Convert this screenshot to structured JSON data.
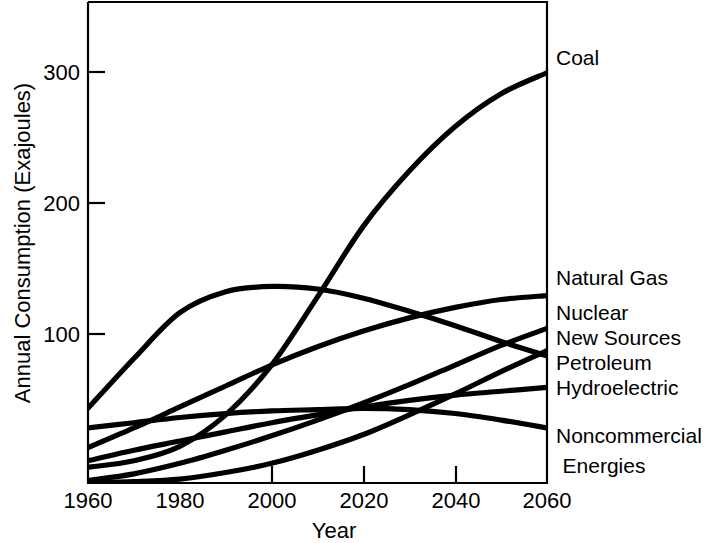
{
  "chart_data": {
    "type": "line",
    "title": "",
    "xlabel": "Year",
    "ylabel": "Annual Consumption (Exajoules)",
    "xlim": [
      1960,
      2060
    ],
    "ylim": [
      0,
      367
    ],
    "xticks": [
      1960,
      1980,
      2000,
      2020,
      2040,
      2060
    ],
    "xticklabels": [
      "1960",
      "1980",
      "2000",
      "2020",
      "2040",
      "2060"
    ],
    "yticks": [
      100,
      200,
      300
    ],
    "yticklabels": [
      "100",
      "200",
      "300"
    ],
    "grid": false,
    "legend_position": "right-outside-line-ends",
    "x": [
      1960,
      1970,
      1980,
      1990,
      2000,
      2010,
      2020,
      2030,
      2040,
      2050,
      2060
    ],
    "series": [
      {
        "name": "Coal",
        "label": "Coal",
        "values": [
          12,
          17,
          28,
          52,
          90,
          142,
          196,
          238,
          272,
          297,
          313
        ]
      },
      {
        "name": "Petroleum",
        "label": "Petroleum",
        "values": [
          57,
          95,
          130,
          146,
          150,
          148,
          141,
          131,
          120,
          108,
          97
        ]
      },
      {
        "name": "Natural Gas",
        "label": "Natural Gas",
        "values": [
          27,
          42,
          58,
          74,
          90,
          104,
          116,
          126,
          134,
          140,
          143
        ]
      },
      {
        "name": "Nuclear",
        "label": "Nuclear",
        "values": [
          2,
          7,
          15,
          25,
          36,
          48,
          61,
          75,
          90,
          105,
          118
        ]
      },
      {
        "name": "New Sources",
        "label": "New Sources",
        "values": [
          0,
          1,
          3,
          8,
          15,
          25,
          37,
          52,
          68,
          85,
          101
        ]
      },
      {
        "name": "Hydroelectric",
        "label": "Hydroelectric",
        "values": [
          17,
          25,
          32,
          39,
          46,
          52,
          58,
          63,
          67,
          70,
          73
        ]
      },
      {
        "name": "Noncommercial Energies",
        "label": "Noncommercial",
        "label_line2": "Energies",
        "values": [
          42,
          46,
          50,
          53,
          55,
          56,
          57,
          56,
          53,
          48,
          42
        ]
      }
    ],
    "right_labels": [
      {
        "text": "Coal",
        "series": "Coal"
      },
      {
        "text": "Natural Gas",
        "series": "Natural Gas"
      },
      {
        "text": "Nuclear",
        "series": "Nuclear"
      },
      {
        "text": "New Sources",
        "series": "New Sources"
      },
      {
        "text": "Petroleum",
        "series": "Petroleum"
      },
      {
        "text": "Hydroelectric",
        "series": "Hydroelectric"
      },
      {
        "text": "Noncommercial",
        "series": "Noncommercial Energies"
      },
      {
        "text": "Energies",
        "series": "Noncommercial Energies"
      }
    ],
    "colors": {
      "line": "#000000",
      "axis": "#000000",
      "background": "#ffffff"
    }
  }
}
